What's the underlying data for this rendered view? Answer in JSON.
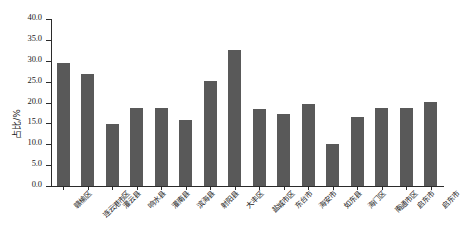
{
  "chart_data": {
    "type": "bar",
    "title": "",
    "xlabel": "",
    "ylabel": "占比/%",
    "ylim": [
      0.0,
      40.0
    ],
    "ytick_step": 5.0,
    "yticks": [
      "0.0",
      "5.0",
      "10.0",
      "15.0",
      "20.0",
      "25.0",
      "30.0",
      "35.0",
      "40.0"
    ],
    "ytick_values": [
      0.0,
      5.0,
      10.0,
      15.0,
      20.0,
      25.0,
      30.0,
      35.0,
      40.0
    ],
    "grid": false,
    "legend": null,
    "bar_color": "#595959",
    "axis_color": "#2b2b2b",
    "categories": [
      "赣榆区",
      "连云港市区",
      "灌云县",
      "响水县",
      "灌南县",
      "滨海县",
      "射阳县",
      "大丰区",
      "盐城市区",
      "东台市",
      "海安市",
      "如东县",
      "海门区",
      "南通市区",
      "启东市",
      "启东市"
    ],
    "values": [
      29.5,
      26.8,
      14.9,
      18.7,
      18.8,
      15.9,
      25.1,
      32.6,
      18.5,
      17.3,
      19.6,
      10.1,
      16.5,
      18.8,
      18.8,
      20.2
    ],
    "series": [
      {
        "name": "占比",
        "values": [
          29.5,
          26.8,
          14.9,
          18.7,
          18.8,
          15.9,
          25.1,
          32.6,
          18.5,
          17.3,
          19.6,
          10.1,
          16.5,
          18.8,
          18.8,
          20.2
        ]
      }
    ]
  }
}
